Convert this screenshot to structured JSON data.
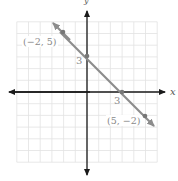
{
  "graph": {
    "x_axis_label": "x",
    "y_axis_label": "y",
    "grid": {
      "xmin": -6,
      "xmax": 6,
      "ymin": -6,
      "ymax": 6,
      "step": 1
    },
    "line": {
      "equation": "x + y = 3",
      "color": "#8c8c8c",
      "points": [
        {
          "x": -2,
          "y": 5,
          "label": "(−2, 5)"
        },
        {
          "x": 0,
          "y": 3,
          "label": "3"
        },
        {
          "x": 3,
          "y": 0,
          "label": "3"
        },
        {
          "x": 5,
          "y": -2,
          "label": "(5, −2)"
        }
      ]
    },
    "colors": {
      "grid": "#e2e2e2",
      "axis": "#1a1a1a",
      "label": "#8a8a8a"
    }
  }
}
